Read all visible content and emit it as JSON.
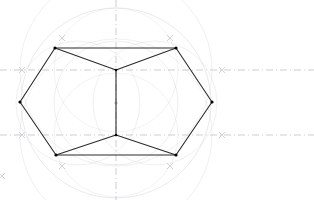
{
  "drawing": {
    "title": "Regular hexagon compass-and-straightedge construction",
    "canvas": {
      "width": 314,
      "height": 200,
      "background": "#ffffff"
    },
    "colors": {
      "hexagon_stroke": "#2b2b2b",
      "vertex_dot": "#000000",
      "construction_arc": "#c9c9d2",
      "construction_arc_light": "#dcdce2",
      "center_line": "#b9b9c4",
      "tick_mark": "#c0c0cb"
    },
    "center_point": {
      "x": 116,
      "y": 103,
      "label": "center"
    },
    "hexagon": {
      "stroke_width": 1.1,
      "vertices": [
        {
          "name": "left",
          "x": 20,
          "y": 102
        },
        {
          "name": "top-left",
          "x": 55,
          "y": 48
        },
        {
          "name": "top-right",
          "x": 176,
          "y": 48
        },
        {
          "name": "right",
          "x": 212,
          "y": 102
        },
        {
          "name": "bottom-right",
          "x": 176,
          "y": 155
        },
        {
          "name": "bottom-left",
          "x": 56,
          "y": 155
        }
      ],
      "points_path": "20,102 55,48 176,48 212,102 176,155 56,155"
    },
    "inner_spokes": {
      "stroke_width": 1.1,
      "upper_node": {
        "x": 116,
        "y": 70
      },
      "lower_node": {
        "x": 116,
        "y": 135
      },
      "segments": [
        {
          "name": "spoke-upper-left",
          "x1": 55,
          "y1": 48,
          "x2": 116,
          "y2": 70
        },
        {
          "name": "spoke-upper-right",
          "x1": 176,
          "y1": 48,
          "x2": 116,
          "y2": 70
        },
        {
          "name": "spoke-vertical",
          "x1": 116,
          "y1": 70,
          "x2": 116,
          "y2": 135
        },
        {
          "name": "spoke-lower-left",
          "x1": 56,
          "y1": 155,
          "x2": 116,
          "y2": 135
        },
        {
          "name": "spoke-lower-right",
          "x1": 176,
          "y1": 155,
          "x2": 116,
          "y2": 135
        }
      ]
    },
    "construction_circles": [
      {
        "name": "circumscribed-circle",
        "cx": 116,
        "cy": 103,
        "r": 95,
        "opacity": 0.55
      },
      {
        "name": "arc-from-upper-node",
        "cx": 116,
        "cy": 70,
        "r": 96,
        "opacity": 0.4
      },
      {
        "name": "arc-from-lower-node",
        "cx": 116,
        "cy": 135,
        "r": 96,
        "opacity": 0.4
      },
      {
        "name": "inner-circle",
        "cx": 116,
        "cy": 103,
        "r": 62,
        "opacity": 0.45
      },
      {
        "name": "arc-left-center",
        "cx": 78,
        "cy": 103,
        "r": 62,
        "opacity": 0.4
      },
      {
        "name": "arc-right-center",
        "cx": 155,
        "cy": 103,
        "r": 62,
        "opacity": 0.4
      },
      {
        "name": "arc-upper-small",
        "cx": 116,
        "cy": 70,
        "r": 62,
        "opacity": 0.35
      },
      {
        "name": "arc-lower-small",
        "cx": 116,
        "cy": 135,
        "r": 62,
        "opacity": 0.35
      }
    ],
    "center_lines": [
      {
        "name": "vertical-center-line",
        "orientation": "vertical",
        "x1": 116,
        "y1": 0,
        "x2": 116,
        "y2": 200
      },
      {
        "name": "horizontal-center-line-upper",
        "orientation": "horizontal",
        "x1": 0,
        "y1": 70,
        "x2": 314,
        "y2": 70
      },
      {
        "name": "horizontal-center-line-lower",
        "orientation": "horizontal",
        "x1": 0,
        "y1": 135,
        "x2": 314,
        "y2": 135
      }
    ],
    "tick_marks": [
      {
        "name": "tick-left-upper",
        "x": 22,
        "y": 70,
        "glyph": "x"
      },
      {
        "name": "tick-right-upper",
        "x": 222,
        "y": 70,
        "glyph": "x"
      },
      {
        "name": "tick-left-lower",
        "x": 22,
        "y": 135,
        "glyph": "x"
      },
      {
        "name": "tick-right-lower",
        "x": 222,
        "y": 135,
        "glyph": "x"
      },
      {
        "name": "tick-arc-upper-left",
        "x": 62,
        "y": 38,
        "glyph": "x"
      },
      {
        "name": "tick-arc-upper-right",
        "x": 170,
        "y": 38,
        "glyph": "x"
      },
      {
        "name": "tick-arc-lower-left",
        "x": 62,
        "y": 166,
        "glyph": "x"
      },
      {
        "name": "tick-arc-lower-right",
        "x": 170,
        "y": 166,
        "glyph": "x"
      },
      {
        "name": "tick-edge-lower-left",
        "x": 2,
        "y": 176,
        "glyph": "x"
      }
    ]
  }
}
